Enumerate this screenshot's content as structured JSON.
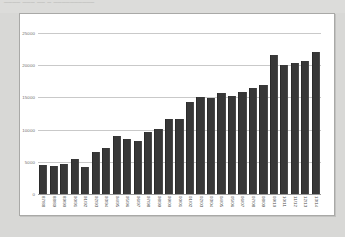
{
  "page": {
    "background_color": "#d8d8d6",
    "panel_background": "#ffffff",
    "panel_border_color": "#a9a9a7",
    "top_cut_text": "____ ___  __ _ __________",
    "top_cut_text_right": ""
  },
  "chart_data": {
    "type": "bar",
    "title": "",
    "subtitle": "",
    "xlabel": "",
    "ylabel": "",
    "ylim": [
      0,
      25000
    ],
    "ytick_values": [
      25000,
      20000,
      15000,
      10000,
      5000,
      0
    ],
    "ytick_labels": [
      "25000",
      "20000",
      "15000",
      "10000",
      "5000",
      "0"
    ],
    "grid": true,
    "grid_axis": "y",
    "legend": false,
    "legend_position": "none",
    "bar_color": "#383838",
    "gridline_color": "#c9c9c9",
    "categories": [
      "87/88",
      "88/89",
      "89/90",
      "90/91",
      "91/92",
      "92/93",
      "93/94",
      "94/95",
      "95/96",
      "96/97",
      "97/98",
      "98/99",
      "99/00",
      "00/01",
      "01/02",
      "02/03",
      "03/04",
      "04/05",
      "05/06",
      "06/07",
      "07/08",
      "08/09",
      "09/10",
      "10/11",
      "11/12",
      "12/13",
      "13/14"
    ],
    "values": [
      4500,
      4300,
      4700,
      5500,
      4200,
      6500,
      7200,
      9000,
      8500,
      8200,
      9700,
      10100,
      11700,
      11700,
      14300,
      15100,
      14900,
      15700,
      15200,
      15800,
      16500,
      17000,
      21600,
      20000,
      20300,
      20700,
      22100
    ]
  }
}
